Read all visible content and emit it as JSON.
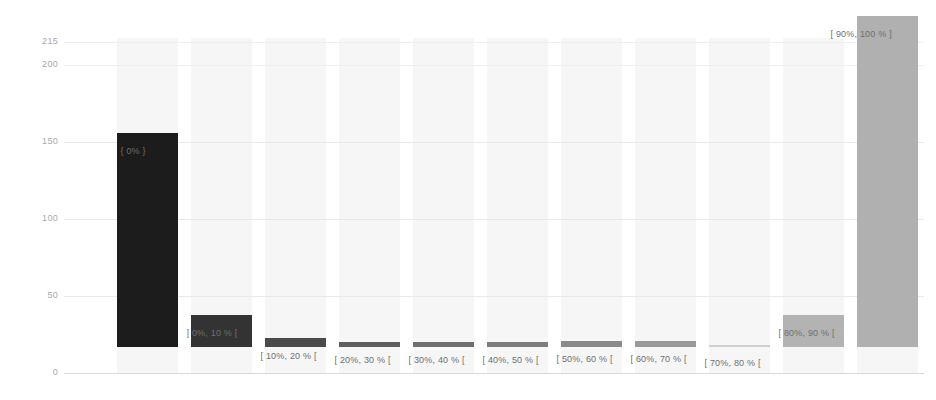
{
  "chart_data": {
    "type": "bar",
    "title": "",
    "xlabel": "",
    "ylabel": "",
    "ylim": [
      0,
      215
    ],
    "grid": true,
    "legend": "none",
    "yticks": [
      {
        "value": 215,
        "label": "215"
      },
      {
        "value": 200,
        "label": "200"
      },
      {
        "value": 150,
        "label": "150"
      },
      {
        "value": 100,
        "label": "100"
      },
      {
        "value": 50,
        "label": "50"
      },
      {
        "value": 0,
        "label": "0"
      }
    ],
    "categories": [
      "{ 0% }",
      "] 0%, 10 % [",
      "[ 10%, 20 % [",
      "[ 20%, 30 % [",
      "[ 30%, 40 % [",
      "[ 40%, 50 % [",
      "[ 50%, 60 % [",
      "[ 60%, 70 % [",
      "[ 70%, 80 % [",
      "[ 80%, 90 % [",
      "[ 90%, 100 % ]"
    ],
    "values": [
      139,
      21,
      6,
      3,
      3,
      3,
      4,
      4,
      1,
      21,
      215
    ],
    "bar_colors": [
      "#1c1c1c",
      "#333333",
      "#4a4a4a",
      "#5e5e5e",
      "#6e6e6e",
      "#7c7c7c",
      "#8a8a8a",
      "#999999",
      "#cfcfcf",
      "#b3b3b3",
      "#b0b0b0"
    ],
    "bar_labels": [
      "{ 0% }",
      "] 0%, 10 % [",
      "[ 10%, 20 % [",
      "[ 20%, 30 % [",
      "[ 30%, 40 % [",
      "[ 40%, 50 % [",
      "[ 50%, 60 % [",
      "[ 60%, 70 % [",
      "[ 70%, 80 % [",
      "[ 80%, 90 % [",
      "[ 90%, 100 % ]"
    ],
    "axis_color": "#a9a9a9",
    "grid_color": "#e9e9e9",
    "band_color": "#f6f6f6",
    "background": "#ffffff"
  }
}
